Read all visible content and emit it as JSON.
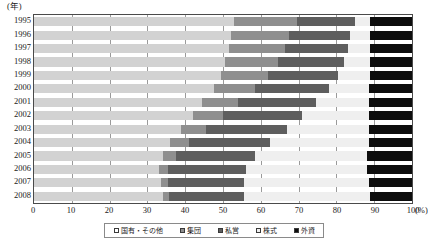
{
  "axes": {
    "y_unit_label": "(年)",
    "x_unit_label": "(%)",
    "x_ticks": [
      "0",
      "10",
      "20",
      "30",
      "40",
      "50",
      "60",
      "70",
      "80",
      "90",
      "100"
    ]
  },
  "legend": {
    "items": [
      {
        "label": "国有・その他",
        "swatch": "open-square-swatch",
        "color": "#d2d2d2"
      },
      {
        "label": "集団",
        "swatch": "gray-square-swatch",
        "color": "#8f8f8f"
      },
      {
        "label": "私営",
        "swatch": "dark-gray-square-swatch",
        "color": "#5e5e5e"
      },
      {
        "label": "株式",
        "swatch": "light-square-swatch",
        "color": "#efefef"
      },
      {
        "label": "外資",
        "swatch": "black-square-swatch",
        "color": "#0d0d0d"
      }
    ]
  },
  "chart_data": {
    "type": "bar",
    "orientation": "horizontal",
    "stacked": true,
    "normalized": true,
    "title": "",
    "xlabel": "(%)",
    "ylabel": "(年)",
    "xlim": [
      0,
      100
    ],
    "grid": true,
    "legend_position": "bottom",
    "categories": [
      "1995",
      "1996",
      "1997",
      "1998",
      "1999",
      "2000",
      "2001",
      "2002",
      "2003",
      "2004",
      "2005",
      "2006",
      "2007",
      "2008"
    ],
    "series": [
      {
        "name": "国有・その他",
        "color": "#d2d2d2",
        "values": [
          53.0,
          52.0,
          51.5,
          50.5,
          49.5,
          47.5,
          44.5,
          42.0,
          39.0,
          36.0,
          34.0,
          33.0,
          33.5,
          34.0
        ]
      },
      {
        "name": "集団",
        "color": "#8f8f8f",
        "values": [
          16.5,
          15.5,
          15.0,
          14.0,
          12.5,
          11.0,
          9.5,
          8.0,
          6.5,
          5.0,
          3.5,
          2.5,
          2.0,
          1.8
        ]
      },
      {
        "name": "私営",
        "color": "#5e5e5e",
        "values": [
          15.5,
          16.0,
          16.5,
          17.5,
          18.5,
          19.5,
          20.5,
          21.0,
          21.5,
          21.5,
          21.0,
          20.5,
          20.0,
          19.7
        ]
      },
      {
        "name": "株式",
        "color": "#efefef",
        "values": [
          4.0,
          5.5,
          6.0,
          7.0,
          8.5,
          10.5,
          14.0,
          17.5,
          21.5,
          26.0,
          29.5,
          32.0,
          33.0,
          33.5
        ]
      },
      {
        "name": "外資",
        "color": "#0d0d0d",
        "values": [
          11.0,
          11.0,
          11.0,
          11.0,
          11.0,
          11.5,
          11.5,
          11.5,
          11.5,
          11.5,
          12.0,
          12.0,
          11.5,
          11.0
        ]
      }
    ]
  }
}
